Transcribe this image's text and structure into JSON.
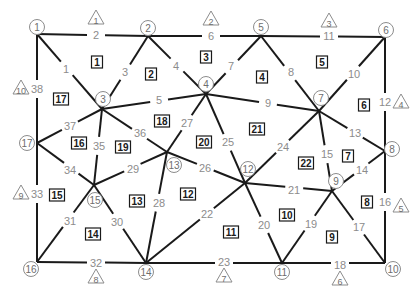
{
  "diagram": {
    "type": "planar-graph",
    "colors": {
      "edge": "#1a1a1a",
      "label": "#8c8c8c",
      "node_outline": "#8c8c8c",
      "face_box": "#1a1a1a"
    },
    "nodes": [
      {
        "id": "1",
        "label": "1",
        "cx": 37,
        "cy": 27,
        "jx": 37,
        "jy": 34
      },
      {
        "id": "2",
        "label": "2",
        "cx": 148,
        "cy": 28,
        "jx": 148,
        "jy": 36
      },
      {
        "id": "5",
        "label": "5",
        "cx": 261,
        "cy": 27,
        "jx": 261,
        "jy": 36
      },
      {
        "id": "6",
        "label": "6",
        "cx": 386,
        "cy": 30,
        "jx": 385,
        "jy": 37
      },
      {
        "id": "3",
        "label": "3",
        "cx": 103,
        "cy": 99,
        "jx": 102,
        "jy": 109
      },
      {
        "id": "4",
        "label": "4",
        "cx": 206,
        "cy": 84,
        "jx": 206,
        "jy": 94
      },
      {
        "id": "7",
        "label": "7",
        "cx": 321,
        "cy": 98,
        "jx": 319,
        "jy": 111
      },
      {
        "id": "17",
        "label": "17",
        "cx": 27,
        "cy": 143,
        "jx": 37,
        "jy": 143
      },
      {
        "id": "8",
        "label": "8",
        "cx": 392,
        "cy": 149,
        "jx": 385,
        "jy": 151
      },
      {
        "id": "13",
        "label": "13",
        "cx": 174,
        "cy": 165,
        "jx": 167,
        "jy": 152
      },
      {
        "id": "12",
        "label": "12",
        "cx": 248,
        "cy": 169,
        "jx": 245,
        "jy": 183
      },
      {
        "id": "9",
        "label": "9",
        "cx": 336,
        "cy": 181,
        "jx": 332,
        "jy": 191
      },
      {
        "id": "15",
        "label": "15",
        "cx": 95,
        "cy": 200,
        "jx": 94,
        "jy": 185
      },
      {
        "id": "16",
        "label": "16",
        "cx": 31,
        "cy": 269,
        "jx": 37,
        "jy": 262
      },
      {
        "id": "14",
        "label": "14",
        "cx": 146,
        "cy": 272,
        "jx": 146,
        "jy": 263
      },
      {
        "id": "11",
        "label": "11",
        "cx": 282,
        "cy": 272,
        "jx": 282,
        "jy": 263
      },
      {
        "id": "10",
        "label": "10",
        "cx": 393,
        "cy": 269,
        "jx": 385,
        "jy": 263
      }
    ],
    "edges": [
      {
        "label": "1",
        "from": "1",
        "to": "3",
        "lx": 66,
        "ly": 69
      },
      {
        "label": "2",
        "from": "1",
        "to": "2",
        "lx": 96,
        "ly": 35
      },
      {
        "label": "3",
        "from": "2",
        "to": "3",
        "lx": 125,
        "ly": 72
      },
      {
        "label": "4",
        "from": "2",
        "to": "4",
        "lx": 176,
        "ly": 66
      },
      {
        "label": "5",
        "from": "3",
        "to": "4",
        "lx": 159,
        "ly": 100
      },
      {
        "label": "6",
        "from": "2",
        "to": "5",
        "lx": 211,
        "ly": 36
      },
      {
        "label": "7",
        "from": "5",
        "to": "4",
        "lx": 231,
        "ly": 66
      },
      {
        "label": "8",
        "from": "5",
        "to": "7",
        "lx": 291,
        "ly": 72
      },
      {
        "label": "9",
        "from": "4",
        "to": "7",
        "lx": 268,
        "ly": 103
      },
      {
        "label": "10",
        "from": "6",
        "to": "7",
        "lx": 354,
        "ly": 74
      },
      {
        "label": "11",
        "from": "5",
        "to": "6",
        "lx": 329,
        "ly": 36
      },
      {
        "label": "12",
        "from": "6",
        "to": "8",
        "lx": 385,
        "ly": 102
      },
      {
        "label": "13",
        "from": "7",
        "to": "8",
        "lx": 355,
        "ly": 133
      },
      {
        "label": "14",
        "from": "8",
        "to": "9",
        "lx": 362,
        "ly": 170
      },
      {
        "label": "15",
        "from": "7",
        "to": "9",
        "lx": 327,
        "ly": 154
      },
      {
        "label": "16",
        "from": "8",
        "to": "10",
        "lx": 385,
        "ly": 202
      },
      {
        "label": "17",
        "from": "9",
        "to": "10",
        "lx": 359,
        "ly": 227
      },
      {
        "label": "18",
        "from": "11",
        "to": "10",
        "lx": 340,
        "ly": 265
      },
      {
        "label": "19",
        "from": "9",
        "to": "11",
        "lx": 311,
        "ly": 224
      },
      {
        "label": "20",
        "from": "12",
        "to": "11",
        "lx": 264,
        "ly": 225
      },
      {
        "label": "21",
        "from": "12",
        "to": "9",
        "lx": 294,
        "ly": 190
      },
      {
        "label": "22",
        "from": "12",
        "to": "14",
        "lx": 207,
        "ly": 214
      },
      {
        "label": "23",
        "from": "14",
        "to": "11",
        "lx": 224,
        "ly": 262
      },
      {
        "label": "24",
        "from": "7",
        "to": "12",
        "lx": 283,
        "ly": 147
      },
      {
        "label": "25",
        "from": "4",
        "to": "12",
        "lx": 228,
        "ly": 142
      },
      {
        "label": "26",
        "from": "13",
        "to": "12",
        "lx": 205,
        "ly": 168
      },
      {
        "label": "27",
        "from": "4",
        "to": "13",
        "lx": 187,
        "ly": 123
      },
      {
        "label": "28",
        "from": "13",
        "to": "14",
        "lx": 159,
        "ly": 203
      },
      {
        "label": "29",
        "from": "15",
        "to": "13",
        "lx": 133,
        "ly": 169
      },
      {
        "label": "30",
        "from": "15",
        "to": "14",
        "lx": 117,
        "ly": 222
      },
      {
        "label": "31",
        "from": "15",
        "to": "16",
        "lx": 70,
        "ly": 221
      },
      {
        "label": "32",
        "from": "16",
        "to": "14",
        "lx": 96,
        "ly": 263
      },
      {
        "label": "33",
        "from": "17",
        "to": "16",
        "lx": 37,
        "ly": 194
      },
      {
        "label": "34",
        "from": "17",
        "to": "15",
        "lx": 70,
        "ly": 170
      },
      {
        "label": "35",
        "from": "3",
        "to": "15",
        "lx": 99,
        "ly": 146
      },
      {
        "label": "36",
        "from": "3",
        "to": "13",
        "lx": 140,
        "ly": 133
      },
      {
        "label": "37",
        "from": "3",
        "to": "17",
        "lx": 70,
        "ly": 126
      },
      {
        "label": "38",
        "from": "1",
        "to": "17",
        "lx": 37,
        "ly": 89
      }
    ],
    "faces": [
      {
        "label": "1",
        "x": 97,
        "y": 62
      },
      {
        "label": "2",
        "x": 151,
        "y": 74
      },
      {
        "label": "3",
        "x": 206,
        "y": 57
      },
      {
        "label": "4",
        "x": 262,
        "y": 77
      },
      {
        "label": "5",
        "x": 322,
        "y": 62
      },
      {
        "label": "6",
        "x": 364,
        "y": 105
      },
      {
        "label": "7",
        "x": 348,
        "y": 156
      },
      {
        "label": "8",
        "x": 367,
        "y": 202
      },
      {
        "label": "9",
        "x": 332,
        "y": 237
      },
      {
        "label": "10",
        "x": 287,
        "y": 215
      },
      {
        "label": "11",
        "x": 231,
        "y": 232
      },
      {
        "label": "12",
        "x": 188,
        "y": 194
      },
      {
        "label": "13",
        "x": 137,
        "y": 201
      },
      {
        "label": "14",
        "x": 93,
        "y": 234
      },
      {
        "label": "15",
        "x": 57,
        "y": 195
      },
      {
        "label": "16",
        "x": 79,
        "y": 143
      },
      {
        "label": "17",
        "x": 61,
        "y": 99
      },
      {
        "label": "18",
        "x": 162,
        "y": 121
      },
      {
        "label": "19",
        "x": 123,
        "y": 147
      },
      {
        "label": "20",
        "x": 204,
        "y": 142
      },
      {
        "label": "21",
        "x": 257,
        "y": 129
      },
      {
        "label": "22",
        "x": 306,
        "y": 163
      }
    ],
    "boundary_markers": [
      {
        "label": "1",
        "x": 96,
        "y": 18
      },
      {
        "label": "2",
        "x": 211,
        "y": 19
      },
      {
        "label": "3",
        "x": 329,
        "y": 21
      },
      {
        "label": "4",
        "x": 401,
        "y": 102
      },
      {
        "label": "5",
        "x": 401,
        "y": 206
      },
      {
        "label": "6",
        "x": 340,
        "y": 279
      },
      {
        "label": "7",
        "x": 224,
        "y": 276
      },
      {
        "label": "8",
        "x": 96,
        "y": 277
      },
      {
        "label": "9",
        "x": 21,
        "y": 193
      },
      {
        "label": "10",
        "x": 21,
        "y": 88
      }
    ]
  }
}
